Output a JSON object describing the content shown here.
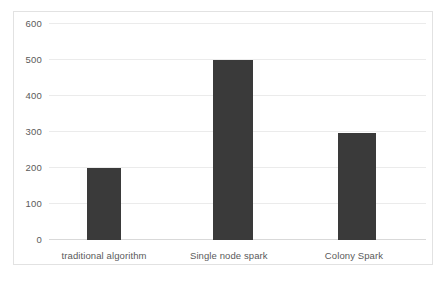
{
  "chart_data": {
    "type": "bar",
    "title": "",
    "subtitle": "",
    "xlabel": "",
    "ylabel": "",
    "categories": [
      "traditional algorithm",
      "Single node spark",
      "Colony Spark"
    ],
    "values": [
      200,
      500,
      297
    ],
    "series": [
      {
        "name": "",
        "values": [
          200,
          500,
          297
        ]
      }
    ],
    "ylim": [
      0,
      600
    ],
    "ytick_labels": [
      "600",
      "500",
      "400",
      "300",
      "200",
      "100",
      "0"
    ],
    "ytick_values": [
      600,
      500,
      400,
      300,
      200,
      100,
      0
    ],
    "ytick_step": 100,
    "grid": true,
    "grid_axis": "y",
    "legend": false,
    "legend_position": "none",
    "annotations": [],
    "colors": {
      "bar": "#3a3a3a",
      "gridline": "#ebebeb",
      "axis": "#d9d9d9",
      "frame": "#e2e2e2",
      "text": "#5a5a5a",
      "background": "#ffffff"
    }
  }
}
